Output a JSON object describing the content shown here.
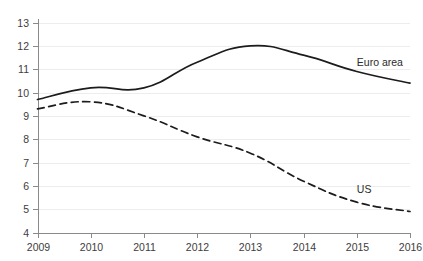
{
  "chart_data": {
    "type": "line",
    "title": "",
    "subtitle": "",
    "xlabel": "",
    "ylabel": "",
    "categories": [
      "2009",
      "2010",
      "2011",
      "2012",
      "2013",
      "2014",
      "2015",
      "2016"
    ],
    "x": [
      2009,
      2010,
      2011,
      2012,
      2013,
      2014,
      2015,
      2016
    ],
    "ylim": [
      4,
      13
    ],
    "yticks": [
      4,
      5,
      6,
      7,
      8,
      9,
      10,
      11,
      12,
      13
    ],
    "ytick_labels": [
      "4",
      "5",
      "6",
      "7",
      "8",
      "9",
      "10",
      "11",
      "12",
      "13"
    ],
    "xtick_labels": [
      "2009",
      "2010",
      "2011",
      "2012",
      "2013",
      "2014",
      "2015",
      "2016"
    ],
    "grid": true,
    "grid_axis": "y",
    "legend_position": "inline-annotation",
    "series": [
      {
        "name": "Euro area",
        "style": "solid",
        "color": "#1c1c1c",
        "values": [
          9.7,
          10.2,
          10.2,
          11.3,
          12.0,
          11.6,
          10.9,
          10.4
        ]
      },
      {
        "name": "US",
        "style": "dashed",
        "color": "#1c1c1c",
        "values": [
          9.3,
          9.6,
          9.0,
          8.1,
          7.4,
          6.2,
          5.3,
          4.9
        ]
      }
    ],
    "annotations": [
      {
        "text": "Euro area",
        "x": 2015.0,
        "y": 11.3
      },
      {
        "text": "US",
        "x": 2015.0,
        "y": 5.85
      }
    ]
  },
  "colors": {
    "background": "#ffffff",
    "gridline": "#ededed",
    "axis": "#8a8a8a",
    "series_line": "#1c1c1c",
    "tick_label": "#3d3d3d"
  }
}
